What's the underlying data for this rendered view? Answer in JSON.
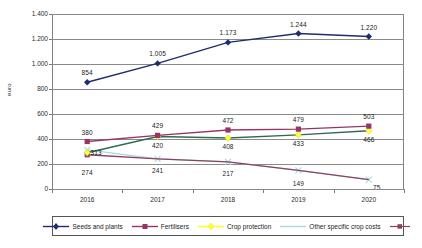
{
  "chart_data": {
    "type": "line",
    "title": "",
    "xlabel": "",
    "ylabel": "euro",
    "ylim": [
      0,
      1400
    ],
    "ystep": 200,
    "grid": true,
    "legend_position": "bottom",
    "categories": [
      "2016",
      "2017",
      "2018",
      "2019",
      "2020"
    ],
    "ytick_labels": [
      "0",
      "200",
      "400",
      "600",
      "800",
      "1.000",
      "1.200",
      "1.400"
    ],
    "ytick_values": [
      0,
      200,
      400,
      600,
      800,
      1000,
      1200,
      1400
    ],
    "series": [
      {
        "name": "Seeds and plants",
        "color": "#1f2d6e",
        "marker": "diamond",
        "values": [
          854,
          1005,
          1173,
          1244,
          1220
        ],
        "labels": [
          "854",
          "1.005",
          "1.173",
          "1.244",
          "1.220"
        ]
      },
      {
        "name": "Fertilisers",
        "color": "#993366",
        "marker": "square",
        "values": [
          380,
          429,
          472,
          479,
          503
        ],
        "labels": [
          "380",
          "429",
          "472",
          "479",
          "503"
        ]
      },
      {
        "name": "Crop protection",
        "color": "#ffff33",
        "line_color": "#2e6b4f",
        "marker": "diamond",
        "values": [
          290,
          420,
          408,
          433,
          466
        ],
        "labels": [
          "",
          "420",
          "408",
          "433",
          "466"
        ]
      },
      {
        "name": "Other specific crop costs",
        "color": "#a8d8e0",
        "marker": "x",
        "values": [
          313,
          241,
          217,
          149,
          75
        ],
        "labels": [
          "313",
          "241",
          "217",
          "149",
          "75"
        ]
      },
      {
        "name": "",
        "color": "#8e4060",
        "marker": "square",
        "values": [
          274,
          241,
          217,
          149,
          75
        ],
        "labels": [
          "274",
          "",
          "",
          "",
          ""
        ]
      }
    ]
  },
  "legend": {
    "items": [
      {
        "label": "Seeds and plants",
        "color": "#1f2d6e",
        "marker": "diamond"
      },
      {
        "label": "Fertilisers",
        "color": "#993366",
        "marker": "square"
      },
      {
        "label": "Crop protection",
        "color": "#ffff33",
        "marker": "diamond"
      },
      {
        "label": "Other specific crop costs",
        "color": "#a8d8e0",
        "marker": "none"
      },
      {
        "label": "",
        "color": "#8e4060",
        "marker": "square"
      }
    ]
  },
  "data_labels": {
    "seeds": [
      {
        "t": "854",
        "x": 0
      },
      {
        "t": "1.005",
        "x": 1
      },
      {
        "t": "1.173",
        "x": 2
      },
      {
        "t": "1.244",
        "x": 3
      },
      {
        "t": "1.220",
        "x": 4
      }
    ],
    "fertilisers": [
      {
        "t": "380",
        "x": 0
      },
      {
        "t": "429",
        "x": 1
      },
      {
        "t": "472",
        "x": 2
      },
      {
        "t": "479",
        "x": 3
      },
      {
        "t": "503",
        "x": 4
      }
    ],
    "crop": [
      {
        "t": "420",
        "x": 1
      },
      {
        "t": "408",
        "x": 2
      },
      {
        "t": "433",
        "x": 3
      },
      {
        "t": "466",
        "x": 4
      }
    ],
    "other": [
      {
        "t": "313",
        "x": 0
      },
      {
        "t": "241",
        "x": 1
      },
      {
        "t": "217",
        "x": 2
      },
      {
        "t": "149",
        "x": 3
      },
      {
        "t": "75",
        "x": 4
      }
    ],
    "fifth": [
      {
        "t": "274",
        "x": 0
      }
    ]
  }
}
